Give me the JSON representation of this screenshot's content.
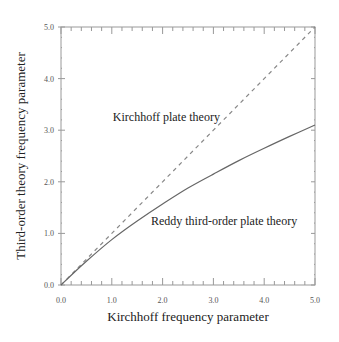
{
  "chart_data": {
    "type": "line",
    "title": "",
    "xlabel": "Kirchhoff frequency parameter",
    "ylabel": "Third-order theory frequency parameter",
    "xlim": [
      0,
      5
    ],
    "ylim": [
      0,
      5
    ],
    "xticks": [
      "0.0",
      "1.0",
      "2.0",
      "3.0",
      "4.0",
      "5.0"
    ],
    "yticks": [
      "0.0",
      "1.0",
      "2.0",
      "3.0",
      "4.0",
      "5.0"
    ],
    "minor_tick_step": 0.2,
    "grid": false,
    "legend": null,
    "x": [
      0,
      0.5,
      1.0,
      1.5,
      2.0,
      2.5,
      3.0,
      3.5,
      4.0,
      4.5,
      5.0
    ],
    "series": [
      {
        "name": "Kirchhoff plate theory",
        "style": "dashed",
        "color": "#888888",
        "values": [
          0,
          0.5,
          1.0,
          1.5,
          2.0,
          2.5,
          3.0,
          3.5,
          4.0,
          4.5,
          5.0
        ]
      },
      {
        "name": "Reddy third-order plate theory",
        "style": "solid",
        "color": "#666666",
        "values": [
          0,
          0.46,
          0.88,
          1.24,
          1.57,
          1.88,
          2.15,
          2.41,
          2.65,
          2.88,
          3.1
        ]
      }
    ],
    "annotations": [
      {
        "text": "Kirchhoff plate theory",
        "x": 1.02,
        "y": 3.25
      },
      {
        "text": "Reddy third-order plate theory",
        "x": 1.77,
        "y": 1.25
      }
    ]
  }
}
